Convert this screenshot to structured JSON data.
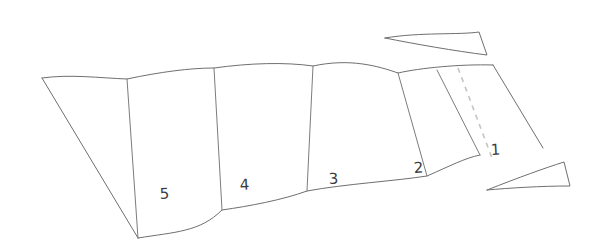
{
  "figure": {
    "background_color": "#ffffff",
    "line_color": "#6d6f72",
    "dashed_line_color": "#c3c4c6",
    "number_color": "#3b3c3e"
  },
  "panels": [
    {
      "id": "panel-1",
      "label": "1",
      "label_x": 491,
      "label_y": 155,
      "face": "M 437,70 L 493,65 L 543,148 L 480,155 Z",
      "leading_crease": "M 437,70 L 480,155"
    },
    {
      "id": "panel-2",
      "label": "2",
      "label_x": 414,
      "label_y": 173,
      "face": "M 398,73 L 437,70 L 480,155 L 427,176 Z",
      "leading_crease": "M 398,73 L 427,176"
    },
    {
      "id": "panel-3",
      "label": "3",
      "label_x": 329,
      "label_y": 184,
      "face": "M 313,66 L 398,73 L 427,176 L 307,191 Z",
      "leading_crease": "M 313,66 L 307,191"
    },
    {
      "id": "panel-4",
      "label": "4",
      "label_x": 240,
      "label_y": 190,
      "face": "M 214,68 L 313,66 L 307,191 L 222,210 Z",
      "leading_crease": "M 214,68 L 222,210"
    },
    {
      "id": "panel-5",
      "label": "5",
      "label_x": 160,
      "label_y": 199,
      "face": "M 127,79 L 214,68 L 222,210 L 138,238 Z",
      "leading_crease": "M 127,79 L 138,238"
    }
  ],
  "outline": {
    "top_edge": "M 42,78 C 70,74 100,78 127,79 C 160,72 190,68 214,68 C 250,63 285,62 313,66 C 350,58 378,66 398,73 C 420,68 460,64 493,65",
    "bottom_edge": "M 138,238 C 175,232 200,232 222,210 C 250,206 282,200 307,191 C 345,184 395,181 427,176 C 450,166 465,158 480,155",
    "left_edge": "M 42,78 L 138,238",
    "right_edge": "M 493,65 L 543,148"
  },
  "dashed_fold": {
    "id": "dashed-crease-panel-1",
    "path": "M 458,68 L 492,158"
  },
  "slivers": [
    {
      "id": "sliver-top-right",
      "path": "M 385,38 C 420,32 460,35 479,32 L 487,55 C 455,51 415,44 385,38 Z"
    },
    {
      "id": "sliver-bottom-right",
      "path": "M 487,190 C 520,177 545,168 564,162 L 570,186 C 540,186 510,188 487,190 Z"
    }
  ]
}
